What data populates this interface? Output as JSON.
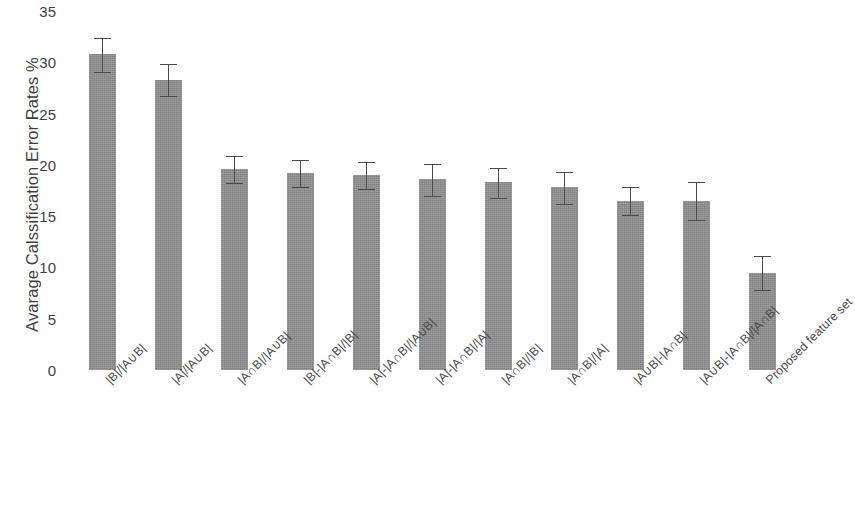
{
  "chart_data": {
    "type": "bar",
    "title": "",
    "subtitle": "",
    "xlabel": "",
    "ylabel": "Avarage Calssification Error Rates %",
    "ylim": [
      0,
      35
    ],
    "yticks": [
      0,
      5,
      10,
      15,
      20,
      25,
      30,
      35
    ],
    "grid": false,
    "legend": null,
    "bar_color": "#8f8f8f",
    "error_bar_color": "#4a4a4a",
    "categories": [
      "|B|/|A∪B|",
      "|A|/|A∪B|",
      "|A∩B|/|A∪B|",
      "|B|-|A∩B|/|B|",
      "|A|-|A∩B|/|A∪B|",
      "|A|-|A∩B|/|A|",
      "|A∩B|/|B|",
      "|A∩B|/|A|",
      "|A∪B|-|A∩B|",
      "|A∪B|-|A∩B|/|A∩B|",
      "Proposed feature set"
    ],
    "values": [
      30.8,
      28.3,
      19.6,
      19.2,
      19.0,
      18.6,
      18.3,
      17.8,
      16.5,
      16.5,
      9.5
    ],
    "errors_upper": [
      1.7,
      1.6,
      1.4,
      1.4,
      1.4,
      1.6,
      1.5,
      1.6,
      1.4,
      1.9,
      1.7
    ],
    "errors_lower": [
      1.7,
      1.6,
      1.4,
      1.4,
      1.4,
      1.6,
      1.5,
      1.6,
      1.4,
      1.9,
      1.7
    ]
  }
}
